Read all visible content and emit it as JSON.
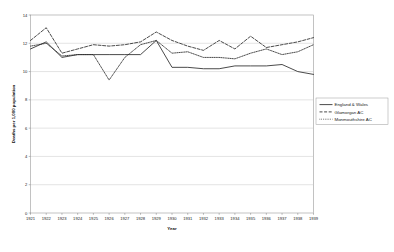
{
  "chart_data": {
    "type": "line",
    "title": "",
    "xlabel": "Year",
    "ylabel": "Deaths per 1,000 population",
    "xlim": [
      1921,
      1939
    ],
    "ylim": [
      0,
      14
    ],
    "grid": true,
    "legend_position": "right-middle",
    "x": [
      1921,
      1922,
      1923,
      1924,
      1925,
      1926,
      1927,
      1928,
      1929,
      1930,
      1931,
      1932,
      1933,
      1934,
      1935,
      1936,
      1937,
      1938,
      1939
    ],
    "xticklabels": [
      "1921",
      "1922",
      "1923",
      "1924",
      "1925",
      "1926",
      "1927",
      "1928",
      "1929",
      "1930",
      "1931",
      "1932",
      "1933",
      "1934",
      "1935",
      "1936",
      "1937",
      "1938",
      "1939"
    ],
    "yticks": [
      0,
      2,
      4,
      6,
      8,
      10,
      12,
      14
    ],
    "yticklabels": [
      "0",
      "2",
      "4",
      "6",
      "8",
      "10",
      "12",
      "14"
    ],
    "series": [
      {
        "name": "England & Wales",
        "style": "solid",
        "values": [
          11.6,
          12.1,
          11.0,
          11.2,
          11.2,
          11.2,
          11.2,
          11.2,
          12.2,
          10.3,
          10.3,
          10.2,
          10.2,
          10.4,
          10.4,
          10.4,
          10.5,
          10.0,
          9.8
        ]
      },
      {
        "name": "Glamorgan AC",
        "style": "dashed",
        "values": [
          12.2,
          13.1,
          11.3,
          11.6,
          11.9,
          11.8,
          11.9,
          12.1,
          12.8,
          12.2,
          11.8,
          11.5,
          12.2,
          11.6,
          12.5,
          11.7,
          11.9,
          12.1,
          12.4
        ]
      },
      {
        "name": "Monmouthshire AC",
        "style": "dotted",
        "values": [
          11.8,
          12.0,
          11.1,
          11.2,
          11.2,
          9.4,
          11.0,
          11.9,
          12.2,
          11.3,
          11.4,
          11.0,
          11.0,
          10.9,
          11.3,
          11.6,
          11.2,
          11.4,
          11.9
        ]
      }
    ]
  },
  "legend": {
    "items": [
      {
        "label": "England & Wales"
      },
      {
        "label": "Glamorgan AC"
      },
      {
        "label": "Monmouthshire AC"
      }
    ]
  }
}
